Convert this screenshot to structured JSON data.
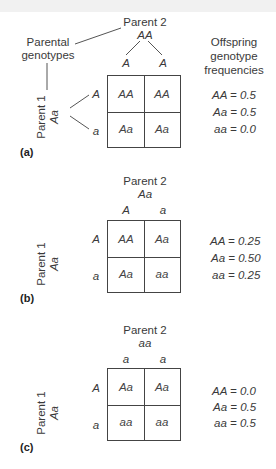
{
  "labels": {
    "parental_genotypes": [
      "Parental",
      "genotypes"
    ],
    "offspring_header": [
      "Offspring",
      "genotype",
      "frequencies"
    ],
    "parent1": "Parent 1",
    "parent2": "Parent 2"
  },
  "panels": [
    {
      "id": "(a)",
      "parent1_genotype": "Aa",
      "parent2_genotype": "AA",
      "parent1_gametes": [
        "A",
        "a"
      ],
      "parent2_gametes": [
        "A",
        "A"
      ],
      "cells": [
        [
          "AA",
          "AA"
        ],
        [
          "Aa",
          "Aa"
        ]
      ],
      "frequencies": [
        "AA = 0.5",
        "Aa = 0.5",
        "aa = 0.0"
      ]
    },
    {
      "id": "(b)",
      "parent1_genotype": "Aa",
      "parent2_genotype": "Aa",
      "parent1_gametes": [
        "A",
        "a"
      ],
      "parent2_gametes": [
        "A",
        "a"
      ],
      "cells": [
        [
          "AA",
          "Aa"
        ],
        [
          "Aa",
          "aa"
        ]
      ],
      "frequencies": [
        "AA = 0.25",
        "Aa = 0.50",
        "aa = 0.25"
      ]
    },
    {
      "id": "(c)",
      "parent1_genotype": "Aa",
      "parent2_genotype": "aa",
      "parent1_gametes": [
        "A",
        "a"
      ],
      "parent2_gametes": [
        "a",
        "a"
      ],
      "cells": [
        [
          "Aa",
          "Aa"
        ],
        [
          "aa",
          "aa"
        ]
      ],
      "frequencies": [
        "AA = 0.0",
        "Aa = 0.5",
        "aa = 0.5"
      ]
    }
  ]
}
